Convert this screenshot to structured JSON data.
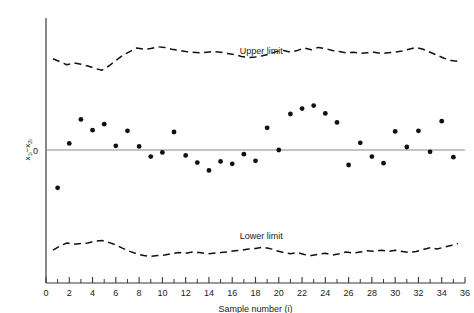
{
  "chart_data": {
    "type": "scatter",
    "title": "",
    "xlabel": "Sample number (i)",
    "ylabel": "x1i - x2i",
    "ylabel_parts": {
      "v1": "x",
      "s1": "1i",
      "dash": "−",
      "v2": "x",
      "s2": "2i"
    },
    "zero_label": "0",
    "xlim": [
      0,
      36
    ],
    "ylim": [
      -1.0,
      1.0
    ],
    "xticks_major": [
      0,
      2,
      4,
      6,
      8,
      10,
      12,
      14,
      16,
      18,
      20,
      22,
      24,
      26,
      28,
      30,
      32,
      34,
      36
    ],
    "xticks_minor": [
      1,
      3,
      5,
      7,
      9,
      11,
      13,
      15,
      17,
      19,
      21,
      23,
      25,
      27,
      29,
      31,
      33,
      35
    ],
    "xtick_labels": [
      "0",
      "2",
      "4",
      "6",
      "8",
      "10",
      "12",
      "14",
      "16",
      "18",
      "20",
      "22",
      "24",
      "26",
      "28",
      "30",
      "32",
      "34",
      "36"
    ],
    "grid": false,
    "legend_position": "inline-annotations",
    "annotations": [
      {
        "text": "Upper limit",
        "x": 18.5,
        "y": 0.8
      },
      {
        "text": "Lower limit",
        "x": 18.5,
        "y": -0.74
      }
    ],
    "series": [
      {
        "name": "x1i - x2i",
        "type": "scatter",
        "marker": "filled-circle",
        "color": "#111111",
        "x": [
          1,
          2,
          3,
          4,
          5,
          6,
          7,
          8,
          9,
          10,
          11,
          12,
          13,
          14,
          15,
          16,
          17,
          18,
          19,
          20,
          21,
          22,
          23,
          24,
          25,
          26,
          27,
          28,
          29,
          30,
          31,
          32,
          33,
          34,
          35
        ],
        "y": [
          -0.315,
          0.055,
          0.255,
          0.165,
          0.215,
          0.035,
          0.16,
          0.03,
          -0.055,
          -0.02,
          0.15,
          -0.045,
          -0.105,
          -0.17,
          -0.095,
          -0.115,
          -0.035,
          -0.09,
          0.185,
          0.0,
          0.3,
          0.345,
          0.37,
          0.305,
          0.23,
          -0.125,
          0.06,
          -0.055,
          -0.11,
          0.155,
          0.025,
          0.16,
          -0.015,
          0.24,
          -0.06
        ]
      },
      {
        "name": "Upper limit",
        "type": "line",
        "style": "dashed",
        "color": "#111111",
        "x": [
          0.6,
          1.2,
          1.8,
          2.4,
          3.0,
          3.6,
          4.2,
          4.8,
          5.4,
          6.0,
          6.6,
          7.2,
          7.8,
          8.4,
          9.0,
          9.6,
          10.2,
          10.8,
          11.4,
          12.0,
          12.6,
          13.2,
          13.8,
          14.4,
          15.0,
          15.6,
          16.2,
          16.8,
          17.4,
          18.0,
          18.6,
          19.2,
          19.8,
          20.4,
          21.0,
          21.6,
          22.2,
          22.8,
          23.4,
          24.0,
          24.6,
          25.2,
          25.8,
          26.4,
          27.0,
          27.6,
          28.2,
          28.8,
          29.4,
          30.0,
          30.6,
          31.2,
          31.8,
          32.4,
          33.0,
          33.6,
          34.2,
          34.8,
          35.4
        ],
        "y": [
          0.76,
          0.735,
          0.71,
          0.725,
          0.715,
          0.7,
          0.68,
          0.665,
          0.7,
          0.745,
          0.79,
          0.82,
          0.85,
          0.84,
          0.845,
          0.86,
          0.855,
          0.84,
          0.83,
          0.82,
          0.815,
          0.81,
          0.815,
          0.82,
          0.815,
          0.805,
          0.795,
          0.78,
          0.77,
          0.775,
          0.785,
          0.8,
          0.82,
          0.83,
          0.815,
          0.83,
          0.85,
          0.835,
          0.855,
          0.845,
          0.83,
          0.82,
          0.81,
          0.815,
          0.805,
          0.81,
          0.815,
          0.805,
          0.81,
          0.815,
          0.825,
          0.84,
          0.855,
          0.84,
          0.815,
          0.79,
          0.765,
          0.745,
          0.74
        ]
      },
      {
        "name": "Lower limit",
        "type": "line",
        "style": "dashed",
        "color": "#111111",
        "x": [
          0.6,
          1.2,
          1.8,
          2.4,
          3.0,
          3.6,
          4.2,
          4.8,
          5.4,
          6.0,
          6.6,
          7.2,
          7.8,
          8.4,
          9.0,
          9.6,
          10.2,
          10.8,
          11.4,
          12.0,
          12.6,
          13.2,
          13.8,
          14.4,
          15.0,
          15.6,
          16.2,
          16.8,
          17.4,
          18.0,
          18.6,
          19.2,
          19.8,
          20.4,
          21.0,
          21.6,
          22.2,
          22.8,
          23.4,
          24.0,
          24.6,
          25.2,
          25.8,
          26.4,
          27.0,
          27.6,
          28.2,
          28.8,
          29.4,
          30.0,
          30.6,
          31.2,
          31.8,
          32.4,
          33.0,
          33.6,
          34.2,
          34.8,
          35.4
        ],
        "y": [
          -0.835,
          -0.8,
          -0.775,
          -0.785,
          -0.78,
          -0.775,
          -0.76,
          -0.755,
          -0.77,
          -0.79,
          -0.82,
          -0.845,
          -0.865,
          -0.88,
          -0.885,
          -0.88,
          -0.875,
          -0.865,
          -0.855,
          -0.86,
          -0.85,
          -0.855,
          -0.865,
          -0.86,
          -0.855,
          -0.85,
          -0.84,
          -0.835,
          -0.825,
          -0.82,
          -0.81,
          -0.82,
          -0.84,
          -0.855,
          -0.865,
          -0.855,
          -0.87,
          -0.88,
          -0.87,
          -0.86,
          -0.875,
          -0.865,
          -0.85,
          -0.86,
          -0.85,
          -0.84,
          -0.845,
          -0.835,
          -0.845,
          -0.835,
          -0.845,
          -0.855,
          -0.845,
          -0.83,
          -0.815,
          -0.825,
          -0.81,
          -0.795,
          -0.78
        ]
      }
    ]
  }
}
